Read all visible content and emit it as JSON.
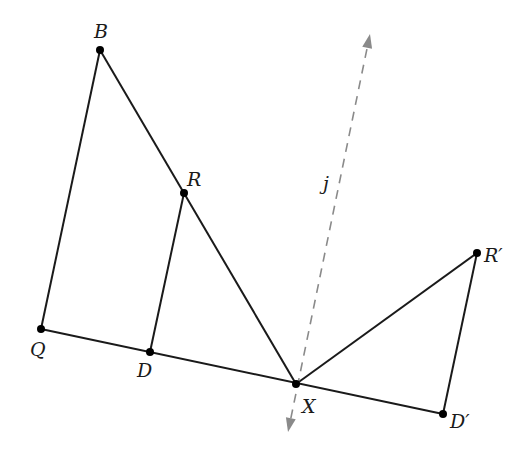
{
  "diagram": {
    "type": "geometric-reflection",
    "colors": {
      "line": "#1a1a1a",
      "dashed_line": "#8a8a8a",
      "point": "#000000"
    },
    "points": [
      {
        "id": "B",
        "label": "B",
        "x": 100,
        "y": 50,
        "lx": 94,
        "ly": 38
      },
      {
        "id": "R",
        "label": "R",
        "x": 184,
        "y": 193,
        "lx": 187,
        "ly": 186
      },
      {
        "id": "Q",
        "label": "Q",
        "x": 41,
        "y": 329,
        "lx": 30,
        "ly": 356
      },
      {
        "id": "D",
        "label": "D",
        "x": 150,
        "y": 352,
        "lx": 137,
        "ly": 377
      },
      {
        "id": "X",
        "label": "X",
        "x": 296,
        "y": 384,
        "lx": 302,
        "ly": 413
      },
      {
        "id": "Rp",
        "label": "R′",
        "x": 477,
        "y": 253,
        "lx": 484,
        "ly": 262
      },
      {
        "id": "Dp",
        "label": "D′",
        "x": 443,
        "y": 414,
        "lx": 450,
        "ly": 428
      }
    ],
    "segments": [
      {
        "from": "B",
        "to": "Q"
      },
      {
        "from": "B",
        "to": "X"
      },
      {
        "from": "R",
        "to": "D"
      },
      {
        "from": "Q",
        "to": "Dp"
      },
      {
        "from": "X",
        "to": "Rp"
      },
      {
        "from": "Rp",
        "to": "Dp"
      }
    ],
    "reflection_line": {
      "label": "j",
      "label_x": 323,
      "label_y": 190,
      "x1": 288,
      "y1": 432,
      "x2": 370,
      "y2": 34,
      "style": "dashed",
      "arrows": "both"
    }
  }
}
